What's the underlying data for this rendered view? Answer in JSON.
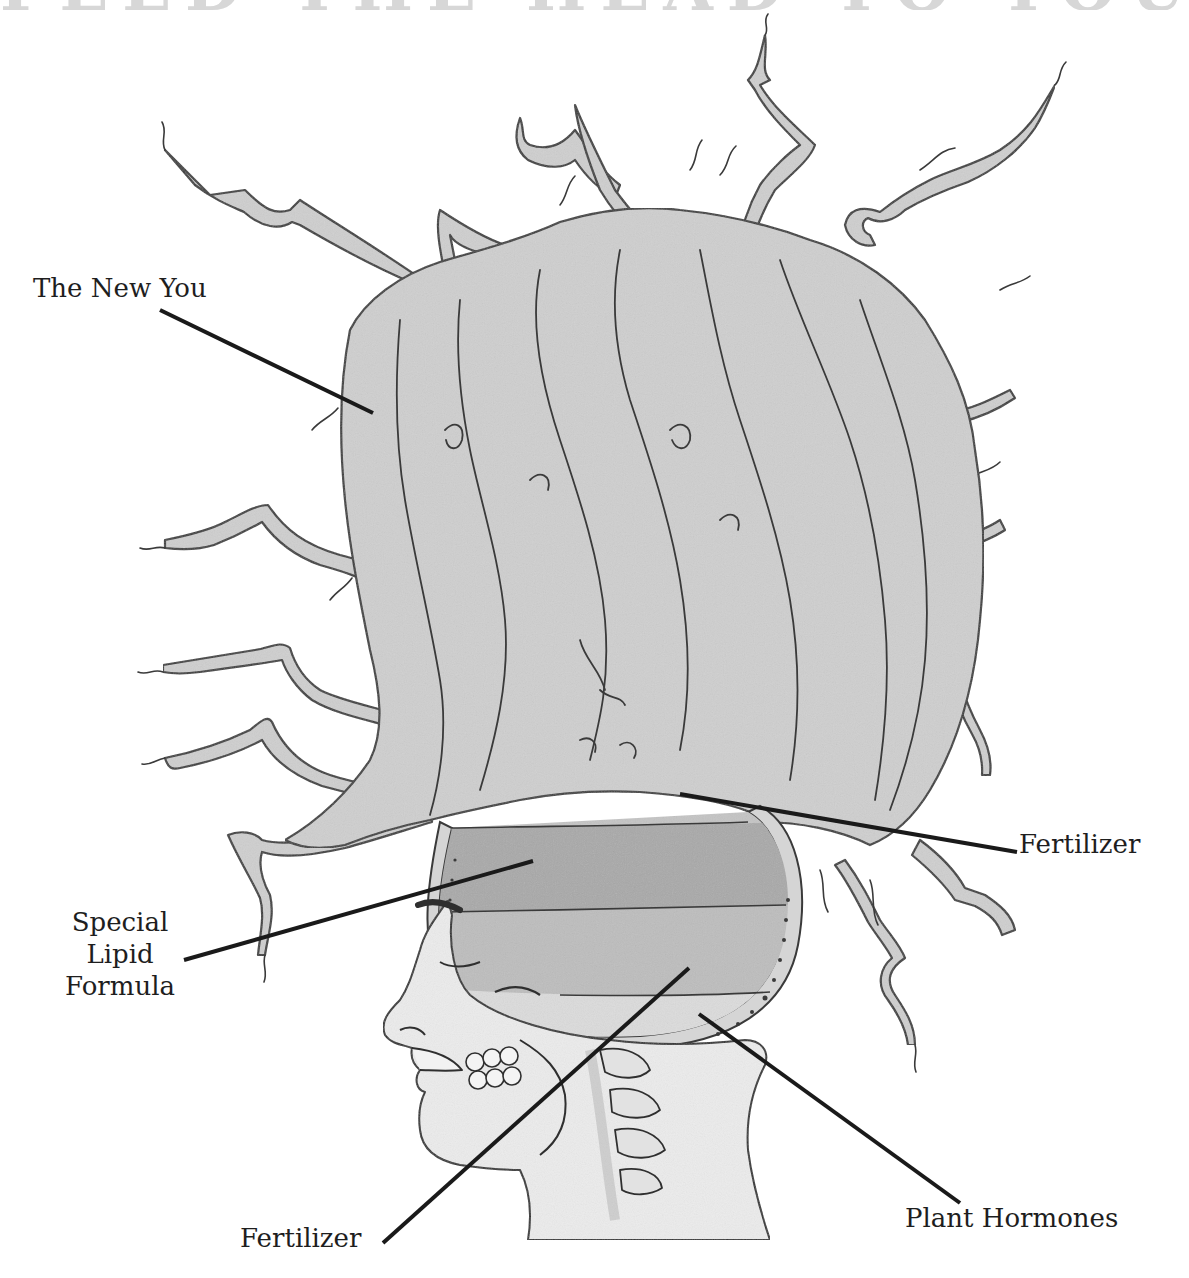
{
  "banner": {
    "text": "FEED THE HEAD TO YOUR REALITY",
    "note": "top banner text clipped; only lower edge of letters visible"
  },
  "colors": {
    "hair_fill": "#cfcfcf",
    "hair_stroke": "#3a3a3a",
    "fertilizer_upper_fill": "#c4c4c4",
    "lipid_fill": "#a9a9a9",
    "fertilizer_lower_fill": "#bdbdbd",
    "hormone_fill": "#dcdcdc",
    "skin_fill": "#ececec",
    "leader_line": "#1a1a1a",
    "label_text": "#1e1e1e"
  },
  "labels": {
    "new_you": "The New You",
    "fertilizer_upper": "Fertilizer",
    "lipid_line1": "Special",
    "lipid_line2": "Lipid",
    "lipid_line3": "Formula",
    "fertilizer_lower": "Fertilizer",
    "plant_hormones": "Plant Hormones"
  }
}
